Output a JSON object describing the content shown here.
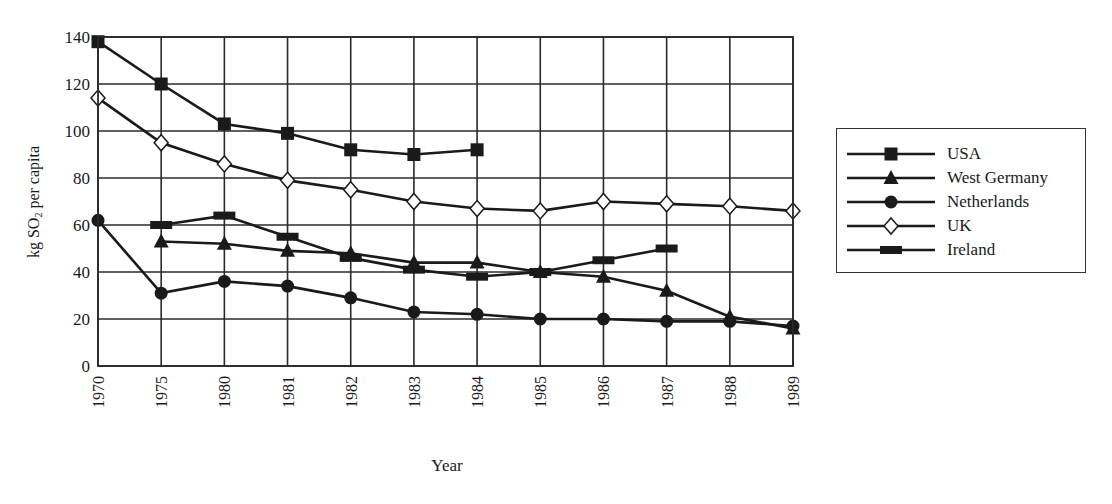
{
  "chart_data": {
    "type": "line",
    "title": "",
    "xlabel": "Year",
    "ylabel_parts": {
      "pre": "kg SO",
      "sub": "2",
      "post": " per capita"
    },
    "ylabel": "kg SO2 per capita",
    "ylim": [
      0,
      140
    ],
    "yticks": [
      0,
      20,
      40,
      60,
      80,
      100,
      120,
      140
    ],
    "grid": true,
    "legend_position": "right",
    "categories": [
      "1970",
      "1975",
      "1980",
      "1981",
      "1982",
      "1983",
      "1984",
      "1985",
      "1986",
      "1987",
      "1988",
      "1989"
    ],
    "series": [
      {
        "name": "USA",
        "marker": "square",
        "values": [
          138,
          120,
          103,
          99,
          92,
          90,
          92,
          null,
          null,
          null,
          null,
          null
        ]
      },
      {
        "name": "West Germany",
        "marker": "triangle",
        "values": [
          null,
          53,
          52,
          49,
          48,
          44,
          44,
          40,
          38,
          32,
          21,
          16
        ]
      },
      {
        "name": "Netherlands",
        "marker": "circle",
        "values": [
          62,
          31,
          36,
          34,
          29,
          23,
          22,
          20,
          20,
          19,
          19,
          17
        ]
      },
      {
        "name": "UK",
        "marker": "diamond",
        "values": [
          114,
          95,
          86,
          79,
          75,
          70,
          67,
          66,
          70,
          69,
          68,
          66
        ]
      },
      {
        "name": "Ireland",
        "marker": "bar",
        "values": [
          null,
          60,
          64,
          55,
          46,
          41,
          38,
          40,
          45,
          50,
          null,
          null
        ]
      }
    ]
  },
  "colors": {
    "line": "#1a1a1a",
    "grid": "#2a2a2a",
    "background": "#ffffff",
    "hollow_fill": "#ffffff"
  }
}
